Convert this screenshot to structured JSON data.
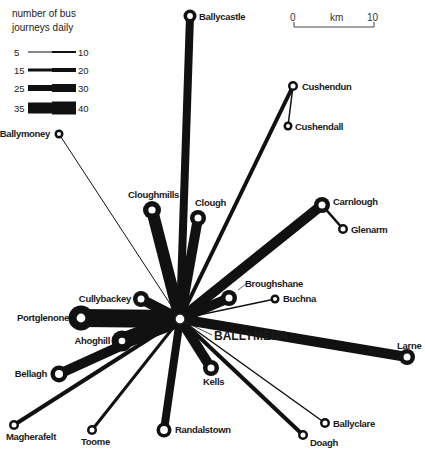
{
  "legend": {
    "title_line1": "number of bus",
    "title_line2": "journeys daily",
    "rows": [
      {
        "min": "5",
        "max": "10",
        "w1": 1,
        "w2": 2
      },
      {
        "min": "15",
        "max": "20",
        "w1": 3,
        "w2": 4
      },
      {
        "min": "25",
        "max": "30",
        "w1": 6,
        "w2": 8
      },
      {
        "min": "35",
        "max": "40",
        "w1": 11,
        "w2": 13
      }
    ]
  },
  "scale": {
    "start": "0",
    "unit": "km",
    "end": "10"
  },
  "hub": {
    "name": "BALLYMENA",
    "x": 180,
    "y": 319
  },
  "routes": [
    {
      "name": "Ballycastle",
      "x": 190,
      "y": 16,
      "w": 8,
      "r": 4.5,
      "lx": 199,
      "ly": 20,
      "anchor": "start"
    },
    {
      "name": "Cushendun",
      "x": 293,
      "y": 86,
      "w": 4,
      "r": 4,
      "lx": 302,
      "ly": 90,
      "anchor": "start"
    },
    {
      "name": "Ballymoney",
      "x": 59,
      "y": 134,
      "w": 1,
      "r": 3.5,
      "lx": 50,
      "ly": 137,
      "anchor": "end"
    },
    {
      "name": "Cloughmills",
      "x": 152,
      "y": 210,
      "w": 12,
      "r": 6,
      "lx": 128,
      "ly": 198,
      "anchor": "start"
    },
    {
      "name": "Clough",
      "x": 198,
      "y": 218,
      "w": 10,
      "r": 5.5,
      "lx": 195,
      "ly": 206,
      "anchor": "start"
    },
    {
      "name": "Carnlough",
      "x": 322,
      "y": 205,
      "w": 10,
      "r": 5.5,
      "lx": 333,
      "ly": 205,
      "anchor": "start"
    },
    {
      "name": "Cullybackey",
      "x": 141,
      "y": 299,
      "w": 10,
      "r": 5.5,
      "lx": 131,
      "ly": 302,
      "anchor": "end"
    },
    {
      "name": "Portglenone",
      "x": 81,
      "y": 318,
      "w": 18,
      "r": 8,
      "lx": 69,
      "ly": 321,
      "anchor": "end"
    },
    {
      "name": "Broughshane",
      "x": 229,
      "y": 298,
      "w": 10,
      "r": 5.5,
      "lx": 245,
      "ly": 287,
      "anchor": "start"
    },
    {
      "name": "Buchna",
      "x": 275,
      "y": 299,
      "w": 1.5,
      "r": 3.5,
      "lx": 283,
      "ly": 302,
      "anchor": "start"
    },
    {
      "name": "Larne",
      "x": 407,
      "y": 357,
      "w": 10,
      "r": 5.5,
      "lx": 397,
      "ly": 349,
      "anchor": "start"
    },
    {
      "name": "Ahoghill",
      "x": 122,
      "y": 341,
      "w": 16,
      "r": 6.5,
      "lx": 110,
      "ly": 344,
      "anchor": "end"
    },
    {
      "name": "Bellagh",
      "x": 59,
      "y": 374,
      "w": 10,
      "r": 6,
      "lx": 47,
      "ly": 377,
      "anchor": "end"
    },
    {
      "name": "Kells",
      "x": 211,
      "y": 368,
      "w": 10,
      "r": 5.5,
      "lx": 203,
      "ly": 385,
      "anchor": "start"
    },
    {
      "name": "Magherafelt",
      "x": 14,
      "y": 425,
      "w": 4,
      "r": 4,
      "lx": 6,
      "ly": 440,
      "anchor": "start"
    },
    {
      "name": "Toome",
      "x": 92,
      "y": 430,
      "w": 3,
      "r": 4,
      "lx": 81,
      "ly": 445,
      "anchor": "start"
    },
    {
      "name": "Randalstown",
      "x": 164,
      "y": 430,
      "w": 8,
      "r": 5.5,
      "lx": 175,
      "ly": 433,
      "anchor": "start"
    },
    {
      "name": "Ballyclare",
      "x": 325,
      "y": 423,
      "w": 1.5,
      "r": 4,
      "lx": 333,
      "ly": 427,
      "anchor": "start"
    },
    {
      "name": "Doagh",
      "x": 303,
      "y": 435,
      "w": 4,
      "r": 4,
      "lx": 310,
      "ly": 446,
      "anchor": "start"
    }
  ],
  "branches": [
    {
      "name": "Cushendall",
      "fx": 293,
      "fy": 86,
      "x": 288,
      "y": 126,
      "w": 1.5,
      "r": 3.5,
      "lx": 295,
      "ly": 130,
      "anchor": "start"
    },
    {
      "name": "Glenarm",
      "fx": 322,
      "fy": 205,
      "x": 343,
      "y": 229,
      "w": 2.5,
      "r": 4,
      "lx": 351,
      "ly": 233,
      "anchor": "start"
    }
  ]
}
